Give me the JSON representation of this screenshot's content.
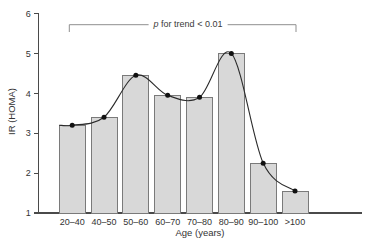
{
  "chart_data": {
    "type": "bar",
    "overlay": "smooth spline line with filled circle markers through bar tops",
    "categories": [
      "20–40",
      "40–50",
      "50–60",
      "60–70",
      "70–80",
      "80–90",
      "90–100",
      ">100"
    ],
    "values": [
      3.2,
      3.4,
      4.45,
      3.95,
      3.9,
      5.0,
      2.25,
      1.55
    ],
    "title": "",
    "xlabel": "Age (years)",
    "ylabel": "IR (HOMA)",
    "ylim": [
      1,
      6
    ],
    "yticks": [
      1,
      2,
      3,
      4,
      5,
      6
    ],
    "grid": false,
    "legend": "none",
    "annotation": {
      "italic_part": "p",
      "text_part": " for trend < 0.01",
      "bracket_from_category": "20–40",
      "bracket_to_category": ">100"
    },
    "colors": {
      "background": "#ffffff",
      "bar_fill": "#d8d8d8",
      "bar_border": "#7a7a7a",
      "line": "#2b2b2b",
      "marker": "#111111",
      "axis": "#4a4a4a",
      "bracket": "#8f8f8f",
      "text": "#333333"
    }
  }
}
